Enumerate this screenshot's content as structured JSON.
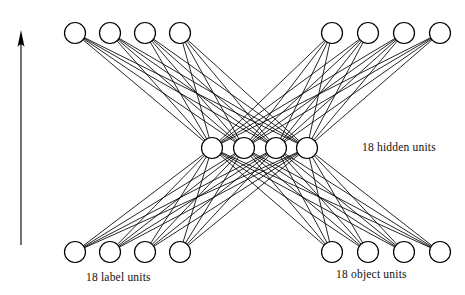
{
  "figure": {
    "type": "neural-network-diagram",
    "background_color": "#ffffff",
    "stroke_color": "#000000",
    "width": 465,
    "height": 295
  },
  "captions": {
    "hidden": "18 hidden units",
    "label": "18 label units",
    "object": "18 object units"
  },
  "arrow": {
    "name": "upward-direction-arrow",
    "x": 21,
    "y_start": 245,
    "y_end": 30,
    "head_width": 7,
    "head_length": 17,
    "color": "#000000"
  },
  "node_style": {
    "radius": 10.5,
    "stroke_width": 1.2,
    "fill": "#ffffff",
    "stroke": "#000000"
  },
  "edge_style": {
    "stroke_width": 0.85,
    "color": "#000000"
  },
  "layers": [
    {
      "id": "top-left",
      "name": "top-left-unit-group",
      "count": 4,
      "y": 33,
      "x": [
        75,
        110,
        145,
        180
      ]
    },
    {
      "id": "top-right",
      "name": "top-right-unit-group",
      "count": 4,
      "y": 33,
      "x": [
        332,
        368,
        404,
        440
      ]
    },
    {
      "id": "hidden",
      "name": "hidden-unit-group",
      "count": 4,
      "y": 148,
      "x": [
        212,
        244,
        276,
        307
      ]
    },
    {
      "id": "bottom-left",
      "name": "bottom-left-unit-group",
      "count": 4,
      "y": 252,
      "x": [
        75,
        110,
        145,
        180
      ]
    },
    {
      "id": "bottom-right",
      "name": "bottom-right-unit-group",
      "count": 4,
      "y": 252,
      "x": [
        332,
        368,
        404,
        440
      ]
    }
  ],
  "connections": [
    {
      "from": "top-left",
      "to": "hidden",
      "mode": "full-bipartite"
    },
    {
      "from": "top-right",
      "to": "hidden",
      "mode": "full-bipartite"
    },
    {
      "from": "bottom-left",
      "to": "hidden",
      "mode": "full-bipartite"
    },
    {
      "from": "bottom-right",
      "to": "hidden",
      "mode": "full-bipartite"
    }
  ]
}
